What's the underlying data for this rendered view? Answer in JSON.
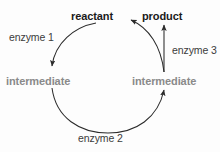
{
  "diagram": {
    "type": "cycle-diagram",
    "title_text": "metabolic cycle",
    "nodes": {
      "reactant": "reactant",
      "product": "product",
      "intermediate_left": "intermediate",
      "intermediate_right": "intermediate"
    },
    "edges": {
      "enzyme1": "enzyme 1",
      "enzyme2": "enzyme 2",
      "enzyme3": "enzyme 3"
    },
    "colors": {
      "primary_text": "#1a1a1a",
      "intermediate_text": "#8a8a8a",
      "enzyme_text": "#3b3b3b",
      "stroke": "#2b2b2b",
      "background": "#fdfdfd"
    }
  }
}
